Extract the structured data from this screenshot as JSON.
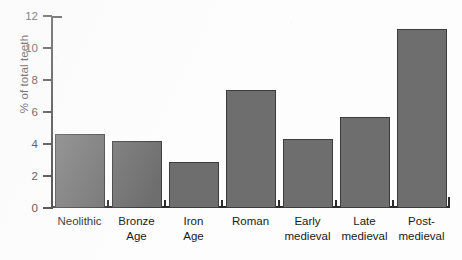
{
  "chart_data": {
    "type": "bar",
    "title": "",
    "xlabel": "",
    "ylabel": "% of total teeth",
    "categories": [
      "Neolithic",
      "Bronze Age",
      "Iron Age",
      "Roman",
      "Early medieval",
      "Late medieval",
      "Post-medieval"
    ],
    "category_lines": [
      [
        "Neolithic"
      ],
      [
        "Bronze",
        "Age"
      ],
      [
        "Iron",
        "Age"
      ],
      [
        "Roman"
      ],
      [
        "Early",
        "medieval"
      ],
      [
        "Late",
        "medieval"
      ],
      [
        "Post-",
        "medieval"
      ]
    ],
    "values": [
      4.6,
      4.2,
      2.9,
      7.4,
      4.3,
      5.7,
      11.2
    ],
    "ylim": [
      0,
      12
    ],
    "ytick_values": [
      0,
      2,
      4,
      6,
      8,
      10,
      12
    ],
    "ytick_labels": [
      "0",
      "2",
      "4",
      "6",
      "8",
      "10",
      "12"
    ],
    "grid": false,
    "legend": null,
    "bar_color": "#6e6e6e",
    "bar_edge_color": "#3c3c3c",
    "axis_color": "#2b2b2b",
    "background_color": "#fdfdfd"
  }
}
